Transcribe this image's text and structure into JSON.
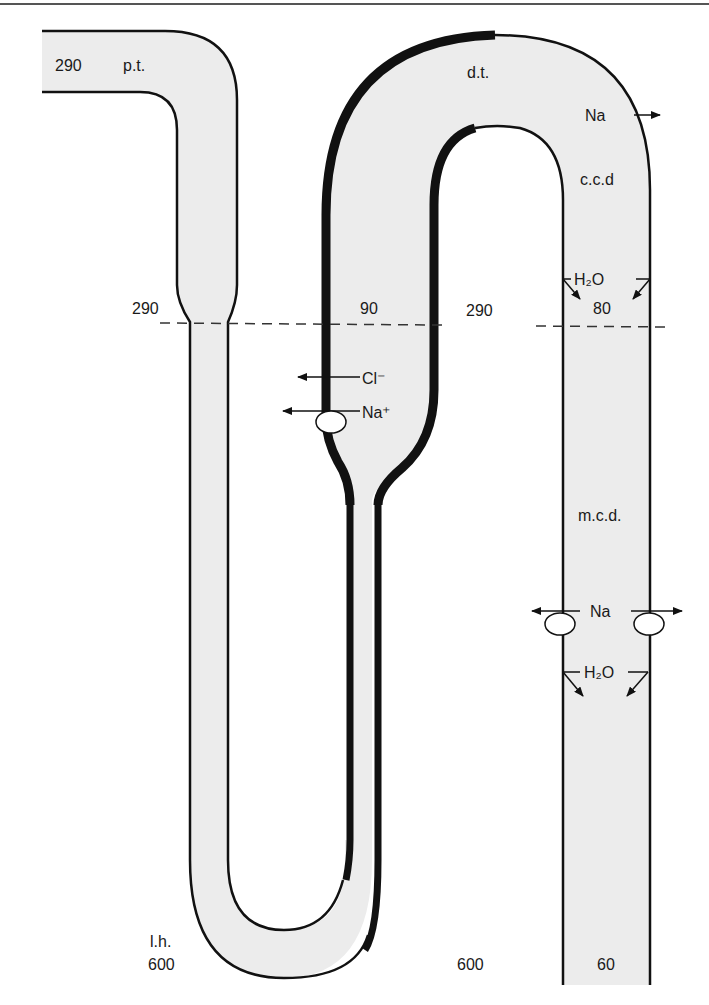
{
  "diagram": {
    "type": "nephron-osmolality-diagram",
    "segments": {
      "proximal_tubule": "p.t.",
      "distal_tubule": "d.t.",
      "cortical_collecting_duct": "c.c.d",
      "medullary_collecting_duct": "m.c.d.",
      "loop_of_henle": "l.h."
    },
    "values": {
      "pt_osmolality": "290",
      "pt_end_osmolality": "290",
      "dt_osmolality": "90",
      "interstitium_cortex": "290",
      "ccd_osmolality": "80",
      "lh_osmolality": "600",
      "interstitium_medulla": "600",
      "mcd_final_osmolality": "60"
    },
    "transport": {
      "dt_na": "Na",
      "ccd_water": "H₂O",
      "tal_cl": "Cl⁻",
      "tal_na": "Na⁺",
      "mcd_na": "Na",
      "mcd_water": "H₂O"
    },
    "colors": {
      "tubule_fill": "#ececec",
      "outline": "#111111",
      "background": "#ffffff"
    }
  }
}
